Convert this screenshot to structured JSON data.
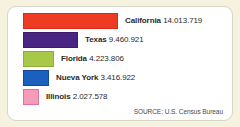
{
  "chart_data": {
    "type": "bar",
    "orientation": "horizontal",
    "title": "",
    "xlabel": "",
    "ylabel": "",
    "categories": [
      "California",
      "Texas",
      "Florida",
      "Nueva York",
      "Illinois"
    ],
    "values": [
      14013719,
      9460921,
      4223806,
      3416922,
      2027578
    ],
    "value_labels": [
      "14.013.719",
      "9.460.921",
      "4.223.806",
      "3.416.922",
      "2.027.578"
    ],
    "bar_colors": [
      "#ee3b24",
      "#4b2583",
      "#a8c84a",
      "#1b5fbf",
      "#f79bb8"
    ],
    "bar_pixel_widths": [
      95,
      55,
      31,
      26,
      16
    ],
    "grid": false,
    "legend": "none",
    "source": "SOURCE: U.S. Census Bureau"
  },
  "panel": {
    "background": "#ffffff",
    "page_background": "#f5f3df",
    "border_color": "#d8d6c6"
  },
  "rows": [
    {
      "state": "California",
      "value": "14.013.719"
    },
    {
      "state": "Texas",
      "value": "9.460.921"
    },
    {
      "state": "Florida",
      "value": "4.223.806"
    },
    {
      "state": "Nueva York",
      "value": "3.416.922"
    },
    {
      "state": "Illinois",
      "value": "2.027.578"
    }
  ],
  "footer": {
    "source": "SOURCE: U.S. Census Bureau"
  }
}
